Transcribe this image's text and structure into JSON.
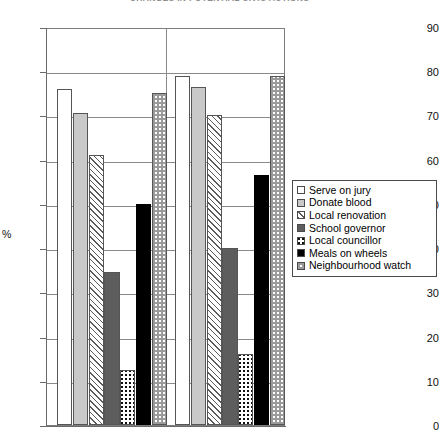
{
  "title": "CHANGES IN POTENTIAL CIVIC ACTIONS",
  "axis": {
    "y_label": "%",
    "y_ticks": [
      "90",
      "80",
      "70",
      "60",
      "50",
      "40",
      "30",
      "20",
      "10",
      "0"
    ]
  },
  "legend": {
    "items": [
      {
        "label": "Serve on jury",
        "swatch": "empty-swatch"
      },
      {
        "label": "Donate blood",
        "swatch": "light-gray-swatch"
      },
      {
        "label": "Local renovation",
        "swatch": "diagonal-hatch-swatch"
      },
      {
        "label": "School governor",
        "swatch": "dark-gray-swatch"
      },
      {
        "label": "Local councillor",
        "swatch": "dark-checker-swatch"
      },
      {
        "label": "Meals on wheels",
        "swatch": "solid-black-swatch"
      },
      {
        "label": "Neighbourhood watch",
        "swatch": "light-checker-swatch"
      }
    ]
  },
  "chart_data": {
    "type": "bar",
    "title": "CHANGES IN POTENTIAL CIVIC ACTIONS",
    "xlabel": "",
    "ylabel": "%",
    "ylim": [
      0,
      90
    ],
    "ytick_step": 10,
    "grid": true,
    "legend_position": "right",
    "categories": [
      "Group 1",
      "Group 2"
    ],
    "series": [
      {
        "name": "Serve on jury",
        "values": [
          76.0,
          79.0
        ],
        "fill": "empty"
      },
      {
        "name": "Donate blood",
        "values": [
          70.5,
          76.5
        ],
        "fill": "light-gray"
      },
      {
        "name": "Local renovation",
        "values": [
          61.0,
          70.0
        ],
        "fill": "diagonal-hatch"
      },
      {
        "name": "School governor",
        "values": [
          34.5,
          40.0
        ],
        "fill": "dark-gray"
      },
      {
        "name": "Local councillor",
        "values": [
          12.5,
          16.0
        ],
        "fill": "dark-checker"
      },
      {
        "name": "Meals on wheels",
        "values": [
          50.0,
          56.5
        ],
        "fill": "solid-black"
      },
      {
        "name": "Neighbourhood watch",
        "values": [
          75.0,
          79.0
        ],
        "fill": "light-checker"
      }
    ]
  }
}
